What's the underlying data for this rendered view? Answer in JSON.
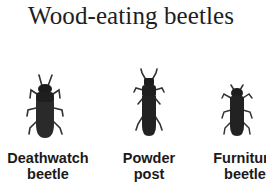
{
  "title": "Wood-eating beetles",
  "beetles": [
    {
      "icon": "deathwatch-beetle-icon",
      "line1": "Deathwatch",
      "line2": "beetle"
    },
    {
      "icon": "powder-post-beetle-icon",
      "line1": "Powder",
      "line2": "post"
    },
    {
      "icon": "furniture-beetle-icon",
      "line1": "Furniture",
      "line2": "beetle"
    }
  ],
  "colors": {
    "beetle_body": "#1c1c1c",
    "text": "#1a1a1a",
    "background": "#ffffff"
  }
}
